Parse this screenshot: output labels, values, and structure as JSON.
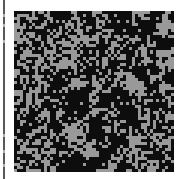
{
  "figure": {
    "title": "",
    "width_px": 181,
    "height_px": 179,
    "background_color": "#ffffff"
  },
  "axis": {
    "name": "left-spine",
    "color": "#4a4a4a",
    "x_px": 3,
    "width_px": 2,
    "tick_color": "#a8a8a8",
    "tick_positions_px": [
      14,
      24,
      40,
      134,
      150,
      164
    ]
  },
  "chart_data": {
    "type": "heatmap",
    "title": "",
    "subtitle": "",
    "xlabel": "",
    "ylabel": "",
    "legend": [],
    "grid": false,
    "plot_rect_px": {
      "x": 14,
      "y": 11,
      "width": 160,
      "height": 161
    },
    "cell_size_px": 3,
    "grid_cols": 53,
    "grid_rows": 53,
    "value_labels": [
      "0",
      "1"
    ],
    "colors": {
      "0": "#0d0d0d",
      "1": "#999999"
    },
    "color_scale": [
      "#0d0d0d",
      "#999999"
    ],
    "fill_fraction_gray": 0.4,
    "cluster_scale": 3.1,
    "random_seed": 20240517
  }
}
